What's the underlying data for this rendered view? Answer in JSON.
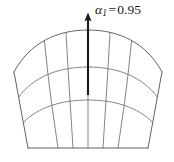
{
  "figure": {
    "type": "mesh-diagram",
    "background_color": "#ffffff",
    "mesh_line_color": "#6e6e6e",
    "outline_color": "#5a5a5a",
    "arrow_color": "#1a1a1a"
  },
  "annotation": {
    "symbol": "α",
    "subscript": "1",
    "equals": "=",
    "value": "0.95",
    "full_text": "α₁ = 0.95"
  },
  "arrow": {
    "name": "alpha1-vector-arrow",
    "direction": "up",
    "tail_x": 88,
    "tail_y": 95,
    "tip_x": 88,
    "tip_y": 14
  },
  "geometry": {
    "columns": 4,
    "rows": 3,
    "apex_x": 88,
    "apex_y": 30,
    "left_shoulder": [
      14,
      72
    ],
    "right_shoulder": [
      162,
      72
    ],
    "bottom_left": [
      28,
      148
    ],
    "bottom_right": [
      148,
      148
    ],
    "row_arcs": [
      {
        "name": "top-arc",
        "sag": 18
      },
      {
        "name": "mid-arc-1",
        "sag": 13
      },
      {
        "name": "mid-arc-2",
        "sag": 9
      },
      {
        "name": "bottom-edge",
        "sag": 0
      }
    ],
    "radial_dividers": [
      {
        "name": "radial-left-outer"
      },
      {
        "name": "radial-left-inner"
      },
      {
        "name": "radial-center"
      },
      {
        "name": "radial-right-inner"
      },
      {
        "name": "radial-right-outer"
      }
    ]
  }
}
